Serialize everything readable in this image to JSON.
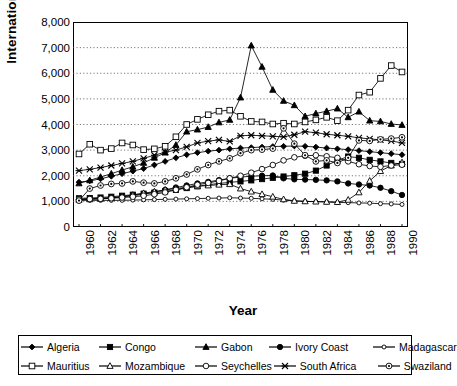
{
  "chart_data": {
    "type": "line",
    "title": "",
    "xlabel": "Year",
    "ylabel": "International Price",
    "xlim": [
      1960,
      1990
    ],
    "ylim": [
      0,
      8000
    ],
    "ytick_labels": [
      "8,000",
      "7,000",
      "6,000",
      "5,000",
      "4,000",
      "3,000",
      "2,000",
      "1,000",
      "0"
    ],
    "ytick_values": [
      8000,
      7000,
      6000,
      5000,
      4000,
      3000,
      2000,
      1000,
      0
    ],
    "xtick_labels": [
      "1960",
      "1962",
      "1964",
      "1966",
      "1968",
      "1970",
      "1972",
      "1974",
      "1976",
      "1978",
      "1980",
      "1982",
      "1984",
      "1986",
      "1988",
      "1990"
    ],
    "xtick_values": [
      1960,
      1962,
      1964,
      1966,
      1968,
      1970,
      1972,
      1974,
      1976,
      1978,
      1980,
      1982,
      1984,
      1986,
      1988,
      1990
    ],
    "grid": "horizontal-dotted",
    "legend_position": "bottom-outside",
    "x": [
      1960,
      1961,
      1962,
      1963,
      1964,
      1965,
      1966,
      1967,
      1968,
      1969,
      1970,
      1971,
      1972,
      1973,
      1974,
      1975,
      1976,
      1977,
      1978,
      1979,
      1980,
      1981,
      1982,
      1983,
      1984,
      1985,
      1986,
      1987,
      1988,
      1989,
      1990
    ],
    "series": [
      {
        "name": "Algeria",
        "marker": "filled-diamond",
        "values": [
          1750,
          1800,
          1880,
          1980,
          2080,
          2180,
          2280,
          2420,
          2560,
          2700,
          2820,
          2900,
          2960,
          3000,
          3050,
          3080,
          3100,
          3120,
          3140,
          3150,
          3160,
          3150,
          3120,
          3080,
          3050,
          3020,
          2980,
          2940,
          2900,
          2860,
          2820
        ]
      },
      {
        "name": "Congo",
        "marker": "filled-square",
        "values": [
          1120,
          1130,
          1150,
          1180,
          1220,
          1260,
          1300,
          1340,
          1390,
          1450,
          1520,
          1590,
          1650,
          1700,
          1740,
          1780,
          1820,
          1870,
          1920,
          1970,
          2020,
          2080,
          2200,
          2400,
          2600,
          2750,
          2700,
          2620,
          2560,
          2500,
          2460
        ]
      },
      {
        "name": "Gabon",
        "marker": "filled-triangle",
        "values": [
          1700,
          1820,
          1950,
          2080,
          2220,
          2350,
          2500,
          2700,
          2900,
          3200,
          3720,
          3800,
          3900,
          4080,
          4180,
          5050,
          7080,
          6250,
          5350,
          4920,
          4750,
          4320,
          4430,
          4520,
          4620,
          4280,
          4500,
          4150,
          4120,
          4020,
          3980
        ]
      },
      {
        "name": "Ivory Coast",
        "marker": "filled-circle",
        "values": [
          1080,
          1100,
          1120,
          1150,
          1180,
          1220,
          1280,
          1360,
          1450,
          1540,
          1620,
          1700,
          1760,
          1830,
          1900,
          1950,
          1980,
          2000,
          2010,
          1900,
          1860,
          1850,
          1840,
          1820,
          1780,
          1700,
          1660,
          1620,
          1530,
          1400,
          1250
        ]
      },
      {
        "name": "Madagascar",
        "marker": "open-circle-small",
        "values": [
          1040,
          1040,
          1040,
          1040,
          1040,
          1050,
          1060,
          1070,
          1080,
          1090,
          1100,
          1110,
          1120,
          1130,
          1140,
          1130,
          1120,
          1100,
          1080,
          1050,
          1020,
          1000,
          990,
          980,
          960,
          950,
          940,
          930,
          910,
          900,
          880
        ]
      },
      {
        "name": "Mauritius",
        "marker": "open-square",
        "values": [
          2850,
          3230,
          3000,
          3060,
          3280,
          3200,
          3020,
          3050,
          3150,
          3520,
          4000,
          4200,
          4380,
          4520,
          4560,
          4320,
          4120,
          4100,
          4020,
          4050,
          4020,
          4100,
          4180,
          4280,
          4150,
          4560,
          5150,
          5260,
          5800,
          6300,
          6050
        ]
      },
      {
        "name": "Mozambique",
        "marker": "open-triangle",
        "values": [
          1060,
          1080,
          1100,
          1130,
          1180,
          1250,
          1320,
          1380,
          1450,
          1500,
          1550,
          1590,
          1620,
          1650,
          1670,
          1500,
          1380,
          1280,
          1180,
          1080,
          1020,
          1000,
          990,
          980,
          970,
          1060,
          1350,
          1800,
          2180,
          2400,
          2520
        ]
      },
      {
        "name": "Seychelles",
        "marker": "open-circle",
        "values": [
          1080,
          1090,
          1100,
          1120,
          1150,
          1180,
          1220,
          1280,
          1350,
          1450,
          1550,
          1650,
          1720,
          1800,
          1900,
          2000,
          2120,
          2260,
          2420,
          2600,
          2720,
          2780,
          2800,
          2760,
          2700,
          2560,
          2450,
          2380,
          2350,
          2400,
          2430
        ]
      },
      {
        "name": "South Africa",
        "marker": "x-cross",
        "values": [
          2200,
          2250,
          2320,
          2400,
          2480,
          2560,
          2680,
          2800,
          2920,
          3000,
          3130,
          3280,
          3350,
          3400,
          3340,
          3560,
          3580,
          3560,
          3540,
          3520,
          3600,
          3720,
          3680,
          3620,
          3580,
          3540,
          3480,
          3440,
          3400,
          3360,
          3280
        ]
      },
      {
        "name": "Swaziland",
        "marker": "circle-dot",
        "values": [
          1030,
          1500,
          1620,
          1680,
          1700,
          1780,
          1730,
          1700,
          1780,
          1900,
          2050,
          2250,
          2420,
          2560,
          2680,
          2880,
          3000,
          3020,
          3060,
          3850,
          3250,
          2800,
          2560,
          2600,
          2500,
          2700,
          3380,
          3360,
          3420,
          3450,
          3500
        ]
      }
    ]
  },
  "legend": {
    "items": [
      {
        "label": "Algeria",
        "marker": "filled-diamond"
      },
      {
        "label": "Congo",
        "marker": "filled-square"
      },
      {
        "label": "Gabon",
        "marker": "filled-triangle"
      },
      {
        "label": "Ivory Coast",
        "marker": "filled-circle"
      },
      {
        "label": "Madagascar",
        "marker": "open-circle-small"
      },
      {
        "label": "Mauritius",
        "marker": "open-square"
      },
      {
        "label": "Mozambique",
        "marker": "open-triangle"
      },
      {
        "label": "Seychelles",
        "marker": "open-circle"
      },
      {
        "label": "South Africa",
        "marker": "x-cross"
      },
      {
        "label": "Swaziland",
        "marker": "circle-dot"
      }
    ]
  },
  "colors": {
    "line": "#000000",
    "grid": "#555555",
    "frame": "#000000",
    "background": "#ffffff"
  }
}
